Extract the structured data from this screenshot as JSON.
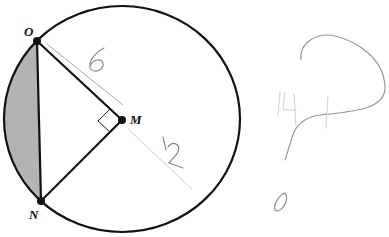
{
  "diagram": {
    "type": "geometry-circle",
    "colors": {
      "stroke": "#111111",
      "shaded_segment": "#b3b3b3",
      "annotation": "#888888",
      "annotation_faint": "#c8c8c8"
    },
    "points": [
      {
        "id": "O",
        "label": "O"
      },
      {
        "id": "M",
        "label": "M"
      },
      {
        "id": "N",
        "label": "N"
      }
    ],
    "segments": [
      "OM",
      "MN",
      "ON"
    ],
    "right_angle_at": "M",
    "shaded_region": "minor segment cut by chord ON",
    "annotations": {
      "om_length": "6",
      "radius_ext_length": "12",
      "side_scribble": "14",
      "question_mark": "?"
    }
  }
}
